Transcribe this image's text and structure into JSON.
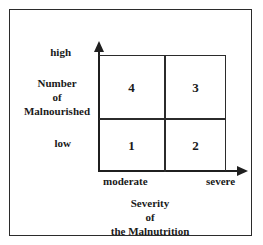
{
  "figure": {
    "type": "quadrant-matrix",
    "colors": {
      "line": "#1f1f1f",
      "frame": "#2b2b2b",
      "background": "#ffffff",
      "text": "#1a1a1a"
    }
  },
  "y_axis": {
    "title_lines": [
      "Number",
      "of",
      "Malnourished"
    ],
    "low_label": "low",
    "high_label": "high",
    "arrow": "up-arrow-icon"
  },
  "x_axis": {
    "title_lines": [
      "Severity",
      "of",
      "the Malnutrition"
    ],
    "low_label": "moderate",
    "high_label": "severe",
    "arrow": "right-arrow-icon"
  },
  "quadrants": {
    "top_left": "4",
    "top_right": "3",
    "bottom_left": "1",
    "bottom_right": "2"
  },
  "chart_data": {
    "type": "table",
    "title": "",
    "xlabel": "Severity of the Malnutrition",
    "ylabel": "Number of Malnourished",
    "x_categories": [
      "moderate",
      "severe"
    ],
    "y_categories": [
      "low",
      "high"
    ],
    "cells": [
      {
        "x": "moderate",
        "y": "high",
        "label": "4"
      },
      {
        "x": "severe",
        "y": "high",
        "label": "3"
      },
      {
        "x": "moderate",
        "y": "low",
        "label": "1"
      },
      {
        "x": "severe",
        "y": "low",
        "label": "2"
      }
    ],
    "grid": true,
    "legend": "none"
  }
}
